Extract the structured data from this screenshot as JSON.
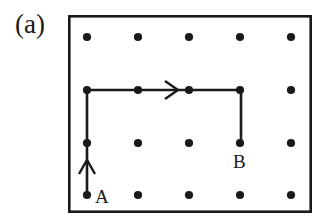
{
  "figure": {
    "panel_label": "(a)",
    "colors": {
      "background": "#ffffff",
      "ink": "#1a1a1a",
      "frame": "#1a1a1a",
      "dot": "#1a1a1a",
      "path": "#1a1a1a"
    }
  },
  "frame": {
    "x": 68,
    "y": 15,
    "width": 244,
    "height": 198,
    "stroke_width": 2.6
  },
  "lattice": {
    "columns_x": [
      87,
      138,
      189,
      240,
      291
    ],
    "rows_y": [
      37,
      90,
      143,
      195
    ],
    "dot_radius": 4.1,
    "spacing_x": 51,
    "spacing_y": 53,
    "dots": [
      {
        "x": 87,
        "y": 37
      },
      {
        "x": 138,
        "y": 37
      },
      {
        "x": 189,
        "y": 37
      },
      {
        "x": 240,
        "y": 37
      },
      {
        "x": 291,
        "y": 37
      },
      {
        "x": 87,
        "y": 90
      },
      {
        "x": 138,
        "y": 90
      },
      {
        "x": 189,
        "y": 90
      },
      {
        "x": 240,
        "y": 90
      },
      {
        "x": 291,
        "y": 90
      },
      {
        "x": 87,
        "y": 143
      },
      {
        "x": 138,
        "y": 143
      },
      {
        "x": 189,
        "y": 143
      },
      {
        "x": 240,
        "y": 143
      },
      {
        "x": 291,
        "y": 143
      },
      {
        "x": 87,
        "y": 195
      },
      {
        "x": 138,
        "y": 195
      },
      {
        "x": 189,
        "y": 195
      },
      {
        "x": 240,
        "y": 195
      },
      {
        "x": 291,
        "y": 195
      }
    ]
  },
  "path": {
    "stroke_width": 2.6,
    "points": "87,195 87,90 241,90 241,143",
    "segments": [
      {
        "name": "vertical-up",
        "x1": 87,
        "y1": 195,
        "x2": 87,
        "y2": 90
      },
      {
        "name": "horizontal-right",
        "x1": 87,
        "y1": 90,
        "x2": 241,
        "y2": 90
      },
      {
        "name": "vertical-down",
        "x1": 241,
        "y1": 90,
        "x2": 241,
        "y2": 143
      }
    ],
    "arrowheads": [
      {
        "name": "up-arrowhead",
        "apex_x": 87,
        "apex_y": 160,
        "points": "79,174 87,160 95,174",
        "direction": "up"
      },
      {
        "name": "right-arrowhead",
        "apex_x": 178,
        "apex_y": 90,
        "points": "165,81 178,90 165,99",
        "direction": "right"
      }
    ]
  },
  "vertices": [
    {
      "id": "A",
      "label": "A",
      "dot_x": 87,
      "dot_y": 195,
      "label_x": 95,
      "label_y": 203
    },
    {
      "id": "B",
      "label": "B",
      "dot_x": 240,
      "dot_y": 143,
      "label_x": 233,
      "label_y": 168
    }
  ]
}
